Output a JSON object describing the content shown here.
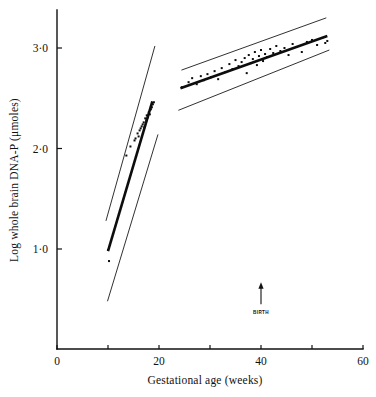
{
  "chart_data": {
    "type": "scatter",
    "title": "",
    "xlabel": "Gestational age (weeks)",
    "ylabel": "Log whole brain DNA-P (μmoles)",
    "xlim": [
      0,
      60
    ],
    "ylim": [
      0.0,
      3.45
    ],
    "grid": false,
    "legend": "none",
    "xticks": [
      0,
      10,
      20,
      30,
      40,
      50,
      60
    ],
    "xtick_labels": [
      "0",
      "",
      "20",
      "",
      "40",
      "",
      "60"
    ],
    "yticks": [
      1.0,
      2.0,
      3.0
    ],
    "ytick_labels": [
      "1·0",
      "2·0",
      "3·0"
    ],
    "annotations": [
      {
        "text": "BIRTH",
        "x": 40,
        "y": 0.45,
        "marker": "up-arrow",
        "description": "Arrow marking time of birth at 40 weeks gestation"
      }
    ],
    "series": [
      {
        "name": "Fetal group (prenatal)",
        "type": "scatter",
        "x": [
          10.0,
          10.2,
          13.6,
          14.4,
          15.2,
          15.4,
          15.8,
          16.0,
          16.2,
          16.4,
          16.6,
          16.8,
          17.0,
          17.1,
          17.3,
          17.5,
          17.6,
          17.8,
          18.0,
          18.2,
          18.4,
          18.6,
          18.8,
          19.0
        ],
        "y": [
          0.99,
          0.88,
          1.93,
          2.02,
          2.08,
          2.1,
          2.15,
          2.12,
          2.18,
          2.2,
          2.22,
          2.24,
          2.26,
          2.21,
          2.3,
          2.28,
          2.33,
          2.31,
          2.36,
          2.34,
          2.39,
          2.41,
          2.44,
          2.46
        ]
      },
      {
        "name": "Postnatal group",
        "type": "scatter",
        "x": [
          24.5,
          25.8,
          26.5,
          27.4,
          28.2,
          28.8,
          29.5,
          30.2,
          30.9,
          31.6,
          32.3,
          33.0,
          33.8,
          34.4,
          35.0,
          35.6,
          36.2,
          36.8,
          37.2,
          37.6,
          38.0,
          38.4,
          38.8,
          39.2,
          39.6,
          40.0,
          40.4,
          40.8,
          41.2,
          41.8,
          42.4,
          43.0,
          43.8,
          44.6,
          45.4,
          46.2,
          47.0,
          48.0,
          49.0,
          50.0,
          51.0,
          52.0,
          52.6,
          53.0
        ],
        "y": [
          2.61,
          2.66,
          2.7,
          2.64,
          2.72,
          2.68,
          2.74,
          2.71,
          2.77,
          2.69,
          2.8,
          2.76,
          2.84,
          2.79,
          2.88,
          2.82,
          2.86,
          2.9,
          2.75,
          2.93,
          2.85,
          2.89,
          2.96,
          2.83,
          2.92,
          2.98,
          2.87,
          2.94,
          2.91,
          2.99,
          2.95,
          3.02,
          2.97,
          3.0,
          2.93,
          3.04,
          3.01,
          2.96,
          3.06,
          3.08,
          3.03,
          3.1,
          3.05,
          3.07
        ]
      },
      {
        "name": "Fetal regression line",
        "type": "line",
        "x": [
          10.0,
          18.7
        ],
        "y": [
          0.98,
          2.47
        ]
      },
      {
        "name": "Fetal lower confidence limit",
        "type": "line",
        "x": [
          9.9,
          19.8
        ],
        "y": [
          0.48,
          2.14
        ]
      },
      {
        "name": "Fetal upper confidence limit",
        "type": "line",
        "x": [
          9.6,
          19.2
        ],
        "y": [
          1.28,
          3.02
        ]
      },
      {
        "name": "Postnatal regression line",
        "type": "line",
        "x": [
          24.2,
          53.0
        ],
        "y": [
          2.6,
          3.12
        ]
      },
      {
        "name": "Postnatal lower confidence limit",
        "type": "line",
        "x": [
          23.8,
          53.4
        ],
        "y": [
          2.38,
          2.98
        ]
      },
      {
        "name": "Postnatal upper confidence limit",
        "type": "line",
        "x": [
          24.4,
          52.8
        ],
        "y": [
          2.78,
          3.3
        ]
      }
    ]
  }
}
